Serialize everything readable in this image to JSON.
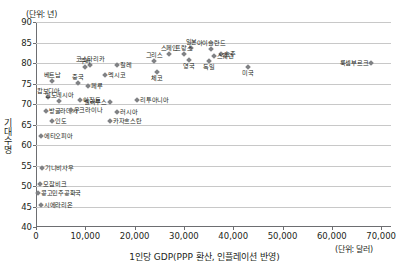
{
  "units": {
    "y": "(단위: 년)",
    "x": "(단위: 달러)"
  },
  "axes": {
    "ylabel": "기대수명",
    "xlabel": "1인당 GDP(PPP 환산, 인플레이션 반영)",
    "yticks": [
      "90",
      "85",
      "80",
      "75",
      "70",
      "65",
      "60",
      "55",
      "50",
      "45",
      "40"
    ],
    "xticks": [
      "0",
      "10,000",
      "20,000",
      "30,000",
      "40,000",
      "50,000",
      "60,000",
      "70,000"
    ]
  },
  "chart_data": {
    "type": "scatter",
    "title": "",
    "xlabel": "1인당 GDP(PPP 환산, 인플레이션 반영)",
    "ylabel": "기대수명",
    "xlim": [
      0,
      72000
    ],
    "ylim": [
      40,
      90
    ],
    "grid": true,
    "legend": "none",
    "marker": "diamond",
    "marker_color": "#808285",
    "points": [
      {
        "label": "룩셈부르크",
        "x": 68000,
        "y": 80.0,
        "pos": "l"
      },
      {
        "label": "아이슬란드",
        "x": 35500,
        "y": 83.5,
        "pos": "t"
      },
      {
        "label": "일본",
        "x": 31500,
        "y": 83.7,
        "pos": "t"
      },
      {
        "label": "호주",
        "x": 37500,
        "y": 82.2,
        "pos": "r"
      },
      {
        "label": "스웨덴",
        "x": 36000,
        "y": 81.7,
        "pos": "r"
      },
      {
        "label": "프랑스",
        "x": 30000,
        "y": 82.1,
        "pos": "t"
      },
      {
        "label": "스페인",
        "x": 27000,
        "y": 82.3,
        "pos": "t"
      },
      {
        "label": "영국",
        "x": 31000,
        "y": 80.7,
        "pos": "b"
      },
      {
        "label": "독일",
        "x": 35000,
        "y": 80.6,
        "pos": "b"
      },
      {
        "label": "그리스",
        "x": 24000,
        "y": 80.6,
        "pos": "t"
      },
      {
        "label": "미국",
        "x": 43000,
        "y": 79.1,
        "pos": "b"
      },
      {
        "label": "체코",
        "x": 24500,
        "y": 77.7,
        "pos": "b"
      },
      {
        "label": "코스타리카",
        "x": 11000,
        "y": 79.6,
        "pos": "t"
      },
      {
        "label": "칠레",
        "x": 16500,
        "y": 79.6,
        "pos": "r"
      },
      {
        "label": "쿠바",
        "x": 10000,
        "y": 79.1,
        "pos": "t"
      },
      {
        "label": "멕시코",
        "x": 14000,
        "y": 77.1,
        "pos": "r"
      },
      {
        "label": "베트남",
        "x": 3300,
        "y": 75.6,
        "pos": "t"
      },
      {
        "label": "중국",
        "x": 8500,
        "y": 75.2,
        "pos": "t"
      },
      {
        "label": "페루",
        "x": 10500,
        "y": 74.5,
        "pos": "r"
      },
      {
        "label": "캄보디아",
        "x": 2500,
        "y": 71.7,
        "pos": "t"
      },
      {
        "label": "인도네시아",
        "x": 4700,
        "y": 70.8,
        "pos": "t"
      },
      {
        "label": "이집트",
        "x": 9000,
        "y": 70.9,
        "pos": "r"
      },
      {
        "label": "벨라루스",
        "x": 15000,
        "y": 70.6,
        "pos": "l"
      },
      {
        "label": "리투아니아",
        "x": 20500,
        "y": 70.9,
        "pos": "r"
      },
      {
        "label": "방글라데시",
        "x": 2000,
        "y": 68.2,
        "pos": "r"
      },
      {
        "label": "우크라이나",
        "x": 7000,
        "y": 68.5,
        "pos": "r"
      },
      {
        "label": "러시아",
        "x": 16500,
        "y": 68.0,
        "pos": "r"
      },
      {
        "label": "인도",
        "x": 3300,
        "y": 65.8,
        "pos": "r"
      },
      {
        "label": "카자흐스탄",
        "x": 15000,
        "y": 65.9,
        "pos": "r"
      },
      {
        "label": "에티오피아",
        "x": 1000,
        "y": 62.2,
        "pos": "r"
      },
      {
        "label": "기니비사우",
        "x": 1200,
        "y": 54.5,
        "pos": "r"
      },
      {
        "label": "모잠비크",
        "x": 900,
        "y": 50.6,
        "pos": "r"
      },
      {
        "label": "콩고민주공화국",
        "x": 400,
        "y": 48.4,
        "pos": "r"
      },
      {
        "label": "시에라리온",
        "x": 1000,
        "y": 45.3,
        "pos": "r"
      }
    ]
  }
}
